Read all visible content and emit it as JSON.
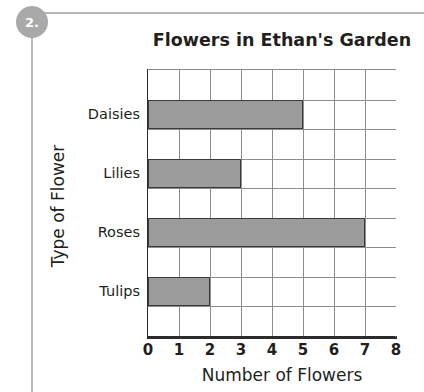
{
  "question": {
    "number": "2."
  },
  "chart_data": {
    "type": "bar",
    "orientation": "horizontal",
    "title": "Flowers in Ethan's Garden",
    "xlabel": "Number of Flowers",
    "ylabel": "Type of Flower",
    "categories": [
      "Daisies",
      "Lilies",
      "Roses",
      "Tulips"
    ],
    "values": [
      5,
      3,
      7,
      2
    ],
    "xticks": [
      "0",
      "1",
      "2",
      "3",
      "4",
      "5",
      "6",
      "7",
      "8"
    ],
    "xlim": [
      0,
      8
    ],
    "grid": true,
    "grid_rows": 9,
    "grid_cols": 8,
    "legend": null,
    "bar_fill_color": "#9b9b9b",
    "bar_stroke_color": "#3a3a3a",
    "grid_color": "#8d8d8d",
    "axis_color": "#2b2b2b",
    "text_color": "#231f20",
    "badge_color": "#a9a9a9"
  }
}
